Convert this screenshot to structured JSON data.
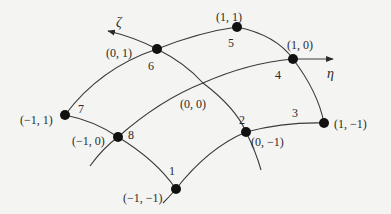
{
  "diagram": {
    "title": "",
    "axes": {
      "zeta": {
        "symbol": "ζ"
      },
      "eta": {
        "symbol": "η"
      }
    },
    "center": {
      "coord_label": "(0, 0)"
    },
    "nodes": [
      {
        "id": "1",
        "number": "1",
        "coord_label": "(−1, −1)"
      },
      {
        "id": "2",
        "number": "2",
        "coord_label": "(0, −1)"
      },
      {
        "id": "3",
        "number": "3",
        "coord_label": "(1, −1)"
      },
      {
        "id": "4",
        "number": "4",
        "coord_label": "(1, 0)"
      },
      {
        "id": "5",
        "number": "5",
        "coord_label": "(1, 1)"
      },
      {
        "id": "6",
        "number": "6",
        "coord_label": "(0, 1)"
      },
      {
        "id": "7",
        "number": "7",
        "coord_label": "(−1, 1)"
      },
      {
        "id": "8",
        "number": "8",
        "coord_label": "(−1, 0)"
      }
    ],
    "colors": {
      "line": "#3a3a3a",
      "node": "#111111",
      "background": "#f4f4f2"
    }
  }
}
